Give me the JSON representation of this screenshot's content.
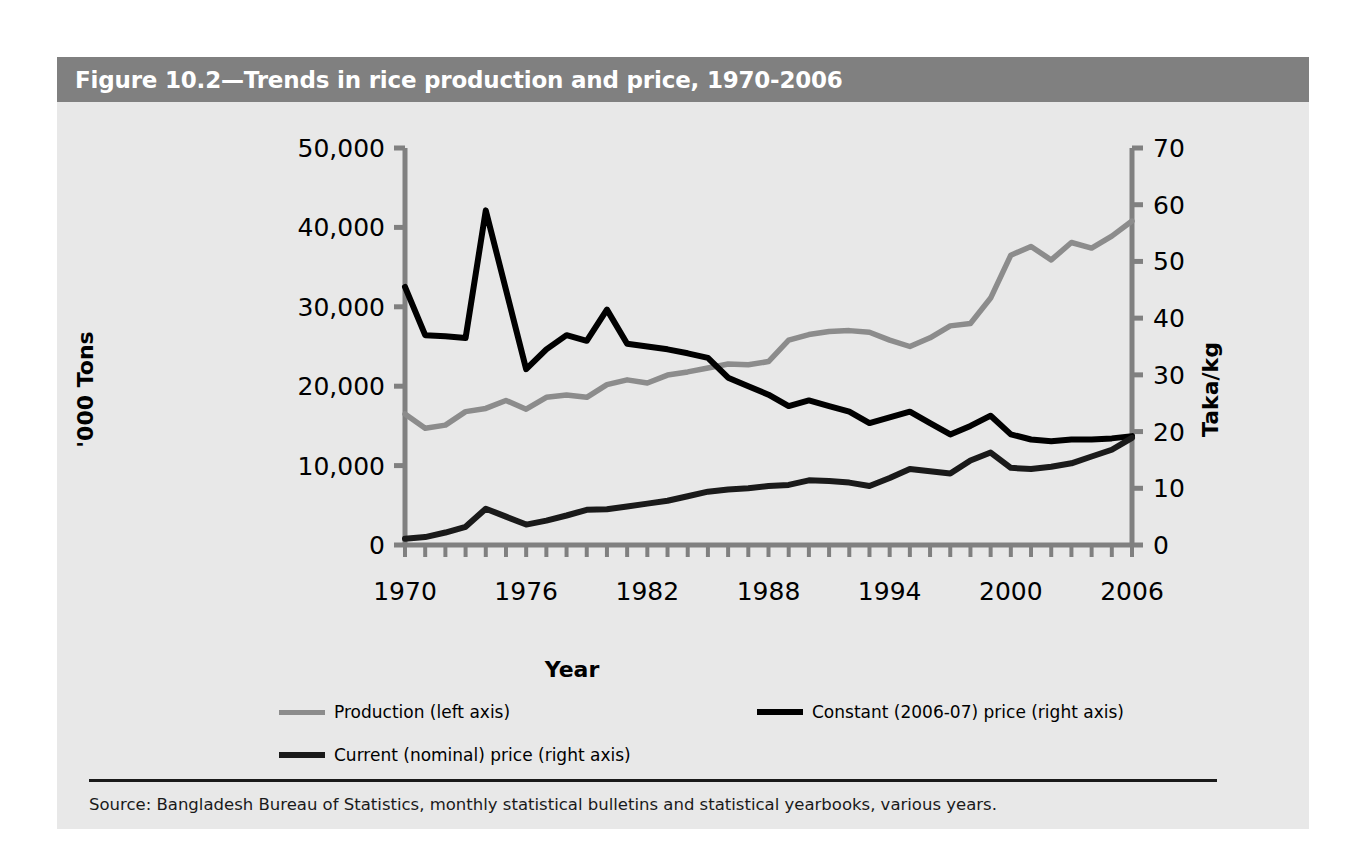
{
  "figure": {
    "title": "Figure 10.2—Trends in rice production and price, 1970-2006",
    "source": "Source: Bangladesh Bureau of Statistics, monthly statistical bulletins and statistical yearbooks, various years."
  },
  "colors": {
    "title_bar": "#808080",
    "figure_background": "#e8e8e8",
    "production": "#8c8c8c",
    "constant_price": "#000000",
    "nominal_price": "#4d4d4d",
    "axis": "#808080",
    "text": "#000000"
  },
  "legend": [
    {
      "label": "Production (left axis)",
      "color": "#8c8c8c",
      "weight": "thin"
    },
    {
      "label": "Constant (2006-07) price (right axis)",
      "color": "#000000",
      "weight": "thick"
    },
    {
      "label": "Current (nominal) price (right axis)",
      "color": "#1a1a1a",
      "weight": "thick"
    }
  ],
  "chart_data": {
    "type": "line",
    "title": "Figure 10.2—Trends in rice production and price, 1970-2006",
    "xlabel": "Year",
    "ylabel": "'000 Tons",
    "ylabel_right": "Taka/kg",
    "xlim": [
      1970,
      2006
    ],
    "ylim": [
      0,
      50000
    ],
    "ylim_right": [
      0,
      70
    ],
    "yticks": [
      0,
      10000,
      20000,
      30000,
      40000,
      50000
    ],
    "ytick_labels": [
      "0",
      "10,000",
      "20,000",
      "30,000",
      "40,000",
      "50,000"
    ],
    "yticks_right": [
      0,
      10,
      20,
      30,
      40,
      50,
      60,
      70
    ],
    "ytick_labels_right": [
      "0",
      "10",
      "20",
      "30",
      "40",
      "50",
      "60",
      "70"
    ],
    "xticks": [
      1970,
      1976,
      1982,
      1988,
      1994,
      2000,
      2006
    ],
    "xtick_labels": [
      "1970",
      "1976",
      "1982",
      "1988",
      "1994",
      "2000",
      "2006"
    ],
    "x_minor_tick_interval": 1,
    "grid": false,
    "legend_position": "below-plot",
    "x": [
      1970,
      1971,
      1972,
      1973,
      1974,
      1975,
      1976,
      1977,
      1978,
      1979,
      1980,
      1981,
      1982,
      1983,
      1984,
      1985,
      1986,
      1987,
      1988,
      1989,
      1990,
      1991,
      1992,
      1993,
      1994,
      1995,
      1996,
      1997,
      1998,
      1999,
      2000,
      2001,
      2002,
      2003,
      2004,
      2005,
      2006
    ],
    "series": [
      {
        "name": "Production (left axis)",
        "axis": "left",
        "unit": "'000 Tons",
        "color": "#8c8c8c",
        "values": [
          16500,
          14700,
          15100,
          16800,
          17200,
          18200,
          17100,
          18600,
          18900,
          18600,
          20200,
          20800,
          20400,
          21400,
          21800,
          22300,
          22800,
          22700,
          23100,
          25800,
          26500,
          26900,
          27000,
          26800,
          25800,
          25000,
          26100,
          27600,
          27900,
          31100,
          36500,
          37600,
          35900,
          38100,
          37400,
          38900,
          40800
        ]
      },
      {
        "name": "Constant (2006-07) price (right axis)",
        "axis": "right",
        "unit": "Taka/kg",
        "color": "#000000",
        "values": [
          45.5,
          37.0,
          36.8,
          36.5,
          59.0,
          45.0,
          31.0,
          34.5,
          37.0,
          36.0,
          41.5,
          35.5,
          35.0,
          34.5,
          33.8,
          33.0,
          29.5,
          28.0,
          26.5,
          24.5,
          25.5,
          24.5,
          23.5,
          21.5,
          22.5,
          23.5,
          21.5,
          19.5,
          21.0,
          22.8,
          19.5,
          18.6,
          18.3,
          18.6,
          18.6,
          18.8,
          19.2
        ]
      },
      {
        "name": "Current (nominal) price (right axis)",
        "axis": "right",
        "unit": "Taka/kg",
        "color": "#1a1a1a",
        "values": [
          1.1,
          1.4,
          2.2,
          3.2,
          6.4,
          5.0,
          3.6,
          4.3,
          5.2,
          6.2,
          6.3,
          6.8,
          7.3,
          7.8,
          8.6,
          9.4,
          9.8,
          10.0,
          10.4,
          10.6,
          11.4,
          11.3,
          11.0,
          10.4,
          11.8,
          13.4,
          13.0,
          12.6,
          14.9,
          16.3,
          13.6,
          13.4,
          13.8,
          14.4,
          15.6,
          16.8,
          18.9
        ]
      }
    ]
  }
}
